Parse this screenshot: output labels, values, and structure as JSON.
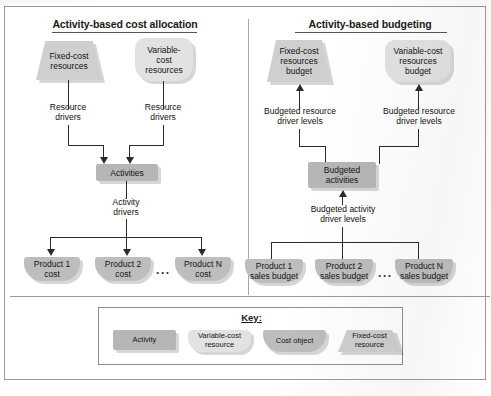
{
  "diagram": {
    "left_panel": {
      "title": "Activity-based cost allocation",
      "fixed_resource": "Fixed-cost\nresources",
      "variable_resource": "Variable-\ncost\nresources",
      "driver_left": "Resource\ndrivers",
      "driver_right": "Resource\ndrivers",
      "activities": "Activities",
      "activity_driver": "Activity\ndrivers",
      "products": [
        "Product 1\ncost",
        "Product 2\ncost",
        "Product N\ncost"
      ],
      "ellipsis": "..."
    },
    "right_panel": {
      "title": "Activity-based budgeting",
      "fixed_resource": "Fixed-cost\nresources\nbudget",
      "variable_resource": "Variable-cost\nresources\nbudget",
      "driver_left": "Budgeted resource\ndriver levels",
      "driver_right": "Budgeted resource\ndriver levels",
      "activities": "Budgeted\nactivities",
      "activity_driver": "Budgeted activity\ndriver levels",
      "products": [
        "Product 1\nsales budget",
        "Product 2\nsales budget",
        "Product N\nsales budget"
      ],
      "ellipsis": "..."
    },
    "key": {
      "title": "Key:",
      "items": [
        {
          "label": "Activity",
          "shape": "activity"
        },
        {
          "label": "Variable-cost\nresource",
          "shape": "variable-cost-resource"
        },
        {
          "label": "Cost object",
          "shape": "cost-object"
        },
        {
          "label": "Fixed-cost\nresource",
          "shape": "fixed-cost-resource"
        }
      ]
    },
    "colors": {
      "activity_fill": "#b6b6b6",
      "cost_object_fill": "#bdbdbd",
      "fixed_resource_fill": "#cfcfcf",
      "variable_resource_fill": "#e2e2e2",
      "connector": "#2b2b2b",
      "border": "#9a9a9a"
    }
  }
}
